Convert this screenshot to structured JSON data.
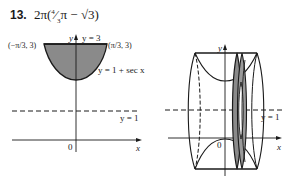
{
  "problem": {
    "number": "13.",
    "answer": "2π(4⁄3π − √3)",
    "answer_parts": {
      "prefix": "2π(",
      "frac_num": "4",
      "frac_den": "3",
      "middle": "π − ",
      "radical": "√3",
      "suffix": ")"
    }
  },
  "left_figure": {
    "y_axis_label": "y",
    "x_axis_label": "x",
    "origin_label": "0",
    "top_line_label": "y = 3",
    "left_point_label": "(−π/3, 3)",
    "right_point_label": "(π/3, 3)",
    "curve_label": "y = 1 + sec x",
    "dashed_line_label": "y = 1",
    "region_fill": "#8a8a8a"
  },
  "right_figure": {
    "y_axis_label": "y",
    "x_axis_label": "x",
    "origin_label": "0",
    "dashed_line_label": "y = 1",
    "washer_fill": "#8a8a8a"
  }
}
